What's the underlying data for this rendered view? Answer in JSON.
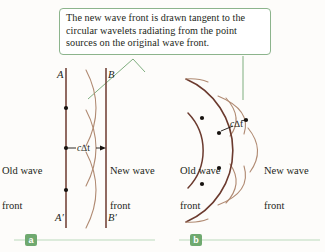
{
  "figure": {
    "background_color": "#fdfcfa",
    "callout": {
      "text": "The new wave front is drawn tangent to the circular wavelets radiating from the point sources on the original wave front.",
      "border_color": "#8cb48c",
      "leader_color": "#7fae7f"
    },
    "colors": {
      "wavefront": "#6b3a2e",
      "wavelet": "#b08a72",
      "dot": "#17120f",
      "text": "#231f20",
      "tag_green": "#6fa96f",
      "rule_green": "#bcd9bc"
    },
    "panel_a": {
      "tag": "a",
      "label_A": "A",
      "label_A_prime": "A′",
      "label_B": "B",
      "label_B_prime": "B′",
      "old_wave_front": "Old wave\nfront",
      "old_wave_front_line1": "Old wave",
      "old_wave_front_line2": "front",
      "new_wave_front_line1": "New wave",
      "new_wave_front_line2": "front",
      "distance_label": "c∆t",
      "distance_symbol_c": "c",
      "distance_symbol_delta_t": "∆t",
      "source_dots": 3,
      "wavelet_arcs": 3
    },
    "panel_b": {
      "tag": "b",
      "old_wave_front_line1": "Old wave",
      "old_wave_front_line2": "front",
      "new_wave_front_line1": "New wave",
      "new_wave_front_line2": "front",
      "distance_label": "c∆t",
      "distance_symbol_c": "c",
      "distance_symbol_delta_t": "∆t",
      "source_dots": 4,
      "wavelet_arcs": 3
    }
  }
}
